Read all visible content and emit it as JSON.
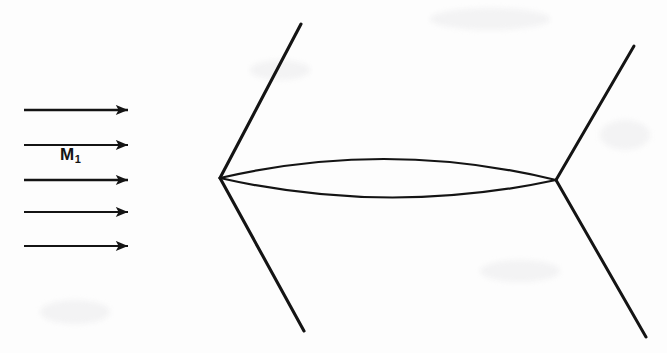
{
  "figure": {
    "background_color": "#fdfdfd",
    "ink_color": "#141414",
    "width": 667,
    "height": 353,
    "freestream_label": {
      "symbol": "M",
      "subscript": "1",
      "x": 60,
      "y": 146
    },
    "flow_arrows": [
      {
        "name": "flow-arrow-1",
        "x1": 24,
        "y1": 110,
        "x2": 140,
        "y2": 110
      },
      {
        "name": "flow-arrow-2",
        "x1": 24,
        "y1": 145,
        "x2": 140,
        "y2": 145
      },
      {
        "name": "flow-arrow-3",
        "x1": 24,
        "y1": 180,
        "x2": 140,
        "y2": 180
      },
      {
        "name": "flow-arrow-4",
        "x1": 24,
        "y1": 212,
        "x2": 140,
        "y2": 212
      },
      {
        "name": "flow-arrow-5",
        "x1": 24,
        "y1": 246,
        "x2": 140,
        "y2": 246
      }
    ],
    "airfoil": {
      "leading_edge": {
        "x": 220,
        "y": 178
      },
      "trailing_edge": {
        "x": 556,
        "y": 180
      },
      "upper_surface_apex": {
        "x": 388,
        "y": 152
      },
      "lower_surface_apex": {
        "x": 388,
        "y": 203
      },
      "upper_path": "M 220 178 Q 388 139 556 180",
      "lower_path": "M 220 178 Q 388 216 556 180"
    },
    "shock_waves": [
      {
        "name": "leading-edge-upper-shock",
        "x1": 220,
        "y1": 178,
        "x2": 301,
        "y2": 24
      },
      {
        "name": "leading-edge-lower-shock",
        "x1": 220,
        "y1": 178,
        "x2": 304,
        "y2": 331
      },
      {
        "name": "trailing-edge-upper-shock",
        "x1": 556,
        "y1": 180,
        "x2": 634,
        "y2": 46
      },
      {
        "name": "trailing-edge-lower-shock",
        "x1": 556,
        "y1": 180,
        "x2": 646,
        "y2": 337
      }
    ],
    "scan_artifacts": [
      {
        "x": 430,
        "y": 8,
        "w": 120,
        "h": 22
      },
      {
        "x": 600,
        "y": 120,
        "w": 50,
        "h": 30
      },
      {
        "x": 40,
        "y": 300,
        "w": 70,
        "h": 24
      },
      {
        "x": 250,
        "y": 60,
        "w": 60,
        "h": 20
      },
      {
        "x": 480,
        "y": 260,
        "w": 80,
        "h": 22
      }
    ]
  }
}
